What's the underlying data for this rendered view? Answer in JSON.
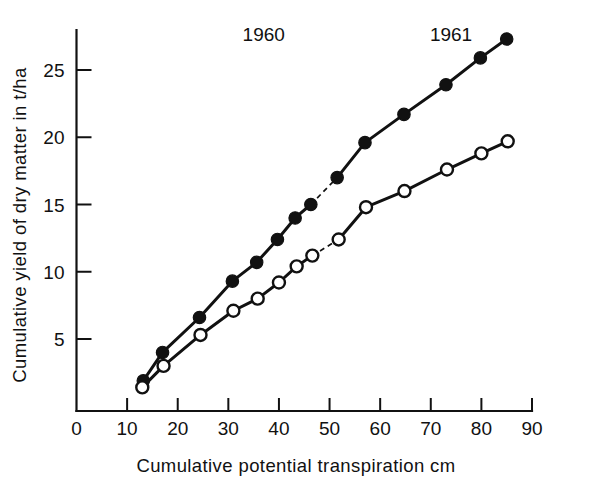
{
  "chart_data": {
    "type": "line",
    "title": "",
    "xlabel": "Cumulative  potential  transpiration  cm",
    "ylabel": "Cumulative yield of dry matter in t/ha",
    "xlim": [
      0,
      90
    ],
    "ylim": [
      0,
      27.8
    ],
    "xticks": [
      0,
      10,
      20,
      30,
      40,
      50,
      60,
      70,
      80,
      90
    ],
    "yticks": [
      5,
      10,
      15,
      20,
      25
    ],
    "xtick_labels": [
      "0",
      "10",
      "20",
      "30",
      "40",
      "50",
      "60",
      "70",
      "80",
      "90"
    ],
    "ytick_labels": [
      "5",
      "10",
      "15",
      "20",
      "25"
    ],
    "grid": false,
    "legend": "none",
    "annotations": [
      {
        "text": "1960",
        "x": 37,
        "y": 27.6,
        "name": "year-label-1960"
      },
      {
        "text": "1961",
        "x": 74,
        "y": 27.6,
        "name": "year-label-1961"
      }
    ],
    "series": [
      {
        "name": "upper-filled-circles",
        "marker": "filled-circle",
        "color": "#111111",
        "points": [
          {
            "x": 13.2,
            "y": 1.9
          },
          {
            "x": 17.0,
            "y": 4.0
          },
          {
            "x": 24.3,
            "y": 6.6
          },
          {
            "x": 30.8,
            "y": 9.3
          },
          {
            "x": 35.6,
            "y": 10.7
          },
          {
            "x": 39.7,
            "y": 12.4
          },
          {
            "x": 43.2,
            "y": 14.0
          },
          {
            "x": 46.3,
            "y": 15.0
          },
          {
            "x": 51.5,
            "y": 17.0
          },
          {
            "x": 57.0,
            "y": 19.6
          },
          {
            "x": 64.7,
            "y": 21.7
          },
          {
            "x": 73.0,
            "y": 23.9
          },
          {
            "x": 79.8,
            "y": 25.9
          },
          {
            "x": 85.0,
            "y": 27.3
          }
        ],
        "dashed_segment": {
          "from_index": 7,
          "to_index": 8
        }
      },
      {
        "name": "lower-open-circles",
        "marker": "open-circle",
        "color": "#111111",
        "points": [
          {
            "x": 13.0,
            "y": 1.4
          },
          {
            "x": 17.2,
            "y": 3.0
          },
          {
            "x": 24.5,
            "y": 5.3
          },
          {
            "x": 31.0,
            "y": 7.1
          },
          {
            "x": 35.8,
            "y": 8.0
          },
          {
            "x": 40.0,
            "y": 9.2
          },
          {
            "x": 43.5,
            "y": 10.4
          },
          {
            "x": 46.6,
            "y": 11.2
          },
          {
            "x": 51.8,
            "y": 12.4
          },
          {
            "x": 57.2,
            "y": 14.8
          },
          {
            "x": 64.8,
            "y": 16.0
          },
          {
            "x": 73.2,
            "y": 17.6
          },
          {
            "x": 80.0,
            "y": 18.8
          },
          {
            "x": 85.2,
            "y": 19.7
          }
        ],
        "dashed_segment": {
          "from_index": 7,
          "to_index": 8
        }
      }
    ]
  },
  "figure": {
    "axis_color": "#111111",
    "background": "#ffffff"
  }
}
